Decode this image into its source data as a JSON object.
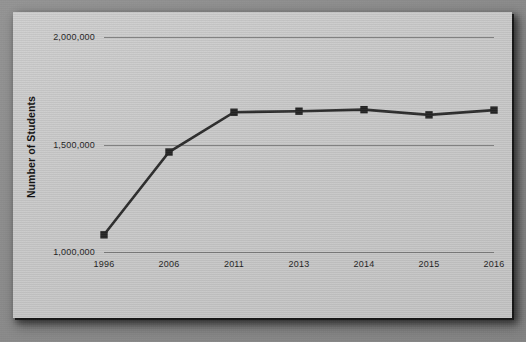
{
  "chart_data": {
    "type": "line",
    "title": "",
    "subtitle": "",
    "xlabel": "",
    "ylabel": "Number of Students",
    "categories": [
      "1996",
      "2006",
      "2011",
      "2013",
      "2014",
      "2015",
      "2016"
    ],
    "x": [
      1996,
      2006,
      2011,
      2013,
      2014,
      2015,
      2016
    ],
    "values": [
      1080000,
      1465000,
      1650000,
      1655000,
      1662000,
      1638000,
      1660000
    ],
    "series": [
      {
        "name": "Number of Students",
        "values": [
          1080000,
          1465000,
          1650000,
          1655000,
          1662000,
          1638000,
          1660000
        ]
      }
    ],
    "ylim": [
      1000000,
      2000000
    ],
    "yticks": [
      1000000,
      1500000,
      2000000
    ],
    "ytick_labels": [
      "1,000,000",
      "1,500,000",
      "2,000,000"
    ],
    "xtick_labels": [
      "1996",
      "2006",
      "2011",
      "2013",
      "2014",
      "2015",
      "2016"
    ],
    "grid": "horizontal",
    "legend": "none",
    "marker": "square",
    "line_color": "#2b2b2b",
    "marker_color": "#232323",
    "gridline_color": "#6f6f6f",
    "plot_background": "#c9c9c9",
    "text_color": "#1d1d1d"
  },
  "axes": {
    "y_title": "Number of Students",
    "y_ticks": [
      {
        "label": "2,000,000",
        "value": 2000000
      },
      {
        "label": "1,500,000",
        "value": 1500000
      },
      {
        "label": "1,000,000",
        "value": 1000000
      }
    ],
    "x_ticks": [
      {
        "label": "1996",
        "value": 1996
      },
      {
        "label": "2006",
        "value": 2006
      },
      {
        "label": "2011",
        "value": 2011
      },
      {
        "label": "2013",
        "value": 2013
      },
      {
        "label": "2014",
        "value": 2014
      },
      {
        "label": "2015",
        "value": 2015
      },
      {
        "label": "2016",
        "value": 2016
      }
    ]
  }
}
